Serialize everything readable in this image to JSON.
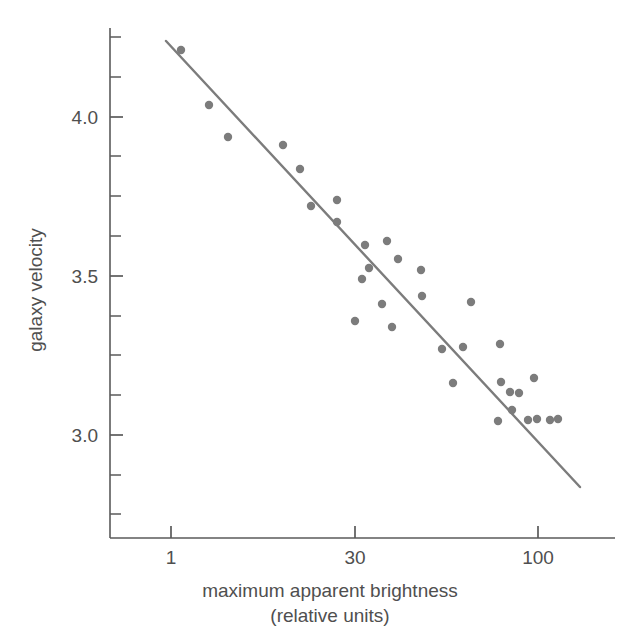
{
  "chart_data": {
    "type": "scatter",
    "title": "",
    "xlabel": "maximum apparent brightness",
    "xlabel_line2": "(relative units)",
    "ylabel": "galaxy velocity",
    "grid": false,
    "legend": "none",
    "x_scale": "log",
    "y_scale": "linear",
    "x_tick_labels": [
      "1",
      "30",
      "100"
    ],
    "x_tick_values": [
      1,
      30,
      100
    ],
    "x_tick_pixels": [
      171,
      355,
      538
    ],
    "y_tick_labels": [
      "4.0",
      "3.5",
      "3.0"
    ],
    "y_tick_values": [
      4.0,
      3.5,
      3.0
    ],
    "y_tick_pixels": [
      117,
      276,
      435
    ],
    "y_minor_tick_pixels": [
      37,
      77,
      117,
      156,
      196,
      236,
      276,
      316,
      355,
      395,
      435,
      475,
      514
    ],
    "ylim": [
      2.85,
      4.25
    ],
    "xlim_pixels": [
      110,
      615
    ],
    "axis_color": "#5a5a5a",
    "marker_color": "#7c7c7c",
    "line_color": "#7c7c7c",
    "marker_radius": 4.2,
    "series": [
      {
        "name": "galaxies",
        "points_pixels": [
          [
            181,
            50
          ],
          [
            209,
            105
          ],
          [
            228,
            137
          ],
          [
            283,
            145
          ],
          [
            300,
            169
          ],
          [
            311,
            206
          ],
          [
            337,
            200
          ],
          [
            337,
            222
          ],
          [
            365,
            245
          ],
          [
            362,
            279
          ],
          [
            369,
            268
          ],
          [
            387,
            241
          ],
          [
            398,
            259
          ],
          [
            355,
            321
          ],
          [
            382,
            304
          ],
          [
            392,
            327
          ],
          [
            421,
            270
          ],
          [
            422,
            296
          ],
          [
            471,
            302
          ],
          [
            442,
            349
          ],
          [
            463,
            347
          ],
          [
            500,
            344
          ],
          [
            453,
            383
          ],
          [
            501,
            382
          ],
          [
            510,
            392
          ],
          [
            519,
            393
          ],
          [
            534,
            378
          ],
          [
            512,
            410
          ],
          [
            498,
            421
          ],
          [
            528,
            420
          ],
          [
            537,
            419
          ],
          [
            550,
            420
          ],
          [
            558,
            419
          ]
        ]
      }
    ],
    "fit_line_pixels": {
      "x1": 166,
      "y1": 41,
      "x2": 580,
      "y2": 487
    }
  },
  "axis_labels": {
    "y_title": "galaxy velocity",
    "x_title_line1": "maximum apparent brightness",
    "x_title_line2": "(relative units)"
  }
}
